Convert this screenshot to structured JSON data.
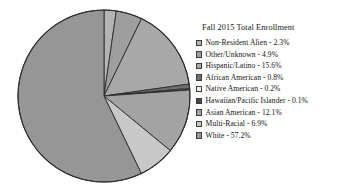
{
  "chart_data": {
    "type": "pie",
    "title": "Fall 2015 Total Enrollment",
    "xlabel": "",
    "ylabel": "",
    "legend_position": "right",
    "grid": false,
    "start_angle_deg": 0,
    "direction": "clockwise",
    "units": "percent",
    "categories": [
      "Non-Resident Alien",
      "Other/Unknown",
      "Hispanic/Latino",
      "African American",
      "Native American",
      "Hawaiian/Pacific Islander",
      "Asian American",
      "Multi-Racial",
      "White"
    ],
    "values": [
      2.3,
      4.9,
      15.6,
      0.8,
      0.2,
      0.1,
      12.1,
      6.9,
      57.2
    ],
    "colors": [
      "#b4b4b4",
      "#9e9e9e",
      "#a8a8a8",
      "#6f6f6f",
      "#f2f2f2",
      "#4a4a4a",
      "#a3a3a3",
      "#c8c8c8",
      "#969696"
    ],
    "slices": [
      {
        "label": "Non-Resident Alien",
        "value": 2.3,
        "value_text": "2.3%",
        "color": "#b4b4b4",
        "legend_text": "Non-Resident Alien - 2.3%"
      },
      {
        "label": "Other/Unknown",
        "value": 4.9,
        "value_text": "4.9%",
        "color": "#9e9e9e",
        "legend_text": "Other/Unknown - 4.9%"
      },
      {
        "label": "Hispanic/Latino",
        "value": 15.6,
        "value_text": "15.6%",
        "color": "#a8a8a8",
        "legend_text": "Hispanic/Latino - 15.6%"
      },
      {
        "label": "African American",
        "value": 0.8,
        "value_text": "0.8%",
        "color": "#6f6f6f",
        "legend_text": "African American - 0.8%"
      },
      {
        "label": "Native American",
        "value": 0.2,
        "value_text": "0.2%",
        "color": "#f2f2f2",
        "legend_text": "Native American - 0.2%"
      },
      {
        "label": "Hawaiian/Pacific Islander",
        "value": 0.1,
        "value_text": "0.1%",
        "color": "#4a4a4a",
        "legend_text": "Hawaiian/Pacific Islander - 0.1%"
      },
      {
        "label": "Asian American",
        "value": 12.1,
        "value_text": "12.1%",
        "color": "#a3a3a3",
        "legend_text": "Asian American - 12.1%"
      },
      {
        "label": "Multi-Racial",
        "value": 6.9,
        "value_text": "6.9%",
        "color": "#c8c8c8",
        "legend_text": "Multi-Racial - 6.9%"
      },
      {
        "label": "White",
        "value": 57.2,
        "value_text": "57.2%",
        "color": "#969696",
        "legend_text": "White - 57.2%"
      }
    ],
    "style": {
      "slice_outline": "#2b2b2b",
      "pie_outline": "#2b2b2b",
      "background": "#ffffff",
      "text_color": "#141414"
    }
  }
}
